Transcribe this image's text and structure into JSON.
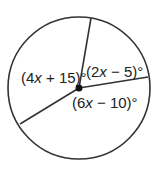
{
  "diagram": {
    "type": "circle-central-angles",
    "circle": {
      "cx": 79,
      "cy": 88,
      "r": 71,
      "stroke": "#333333"
    },
    "center_point": {
      "cx": 79,
      "cy": 88,
      "r": 3.5
    },
    "radii": [
      {
        "x2": 91,
        "y2": 18
      },
      {
        "x2": 148,
        "y2": 77
      },
      {
        "x2": 20,
        "y2": 124
      }
    ],
    "angles": [
      {
        "label_pre": "(4",
        "var": "x",
        "label_post": " + 15)°",
        "x": 22,
        "y": 83
      },
      {
        "label_pre": "(2",
        "var": "x",
        "label_post": " − 5)°",
        "x": 86,
        "y": 78
      },
      {
        "label_pre": "(6",
        "var": "x",
        "label_post": " − 10)°",
        "x": 72,
        "y": 108
      }
    ]
  }
}
